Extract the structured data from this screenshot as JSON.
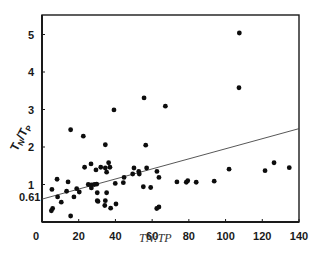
{
  "chart_data": {
    "type": "scatter",
    "title": "",
    "xlabel": "TN:TP",
    "ylabel": "T_N/T_P",
    "xlim": [
      0,
      140
    ],
    "ylim": [
      0,
      5.5
    ],
    "x_ticks": [
      0,
      20,
      40,
      60,
      80,
      100,
      120,
      140
    ],
    "y_ticks": [
      1,
      2,
      3,
      4,
      5
    ],
    "y_annotation": {
      "value": 0.61,
      "label": "0.61"
    },
    "grid": false,
    "legend": null,
    "regression_line": {
      "x": [
        0,
        140
      ],
      "y": [
        0.61,
        2.49
      ]
    },
    "series": [
      {
        "name": "observations",
        "points": [
          [
            15.6,
            2.46
          ],
          [
            22.5,
            2.29
          ],
          [
            23.2,
            1.46
          ],
          [
            26.7,
            1.55
          ],
          [
            29.4,
            1.39
          ],
          [
            8.2,
            1.14
          ],
          [
            14.2,
            1.07
          ],
          [
            5.4,
            0.87
          ],
          [
            13.4,
            0.82
          ],
          [
            18.9,
            0.89
          ],
          [
            20.3,
            0.8
          ],
          [
            17.4,
            0.67
          ],
          [
            8.5,
            0.67
          ],
          [
            10.5,
            0.53
          ],
          [
            5.8,
            0.36
          ],
          [
            5.1,
            0.3
          ],
          [
            15.6,
            0.16
          ],
          [
            25.2,
            1.0
          ],
          [
            26.9,
            0.99
          ],
          [
            28.5,
            1.0
          ],
          [
            29.8,
            1.01
          ],
          [
            26.9,
            0.91
          ],
          [
            30.1,
            0.78
          ],
          [
            30.1,
            0.57
          ],
          [
            32.0,
            1.46
          ],
          [
            34.5,
            1.44
          ],
          [
            36.3,
            1.58
          ],
          [
            37.0,
            1.46
          ],
          [
            35.2,
            1.33
          ],
          [
            35.2,
            0.78
          ],
          [
            30.5,
            0.55
          ],
          [
            34.5,
            0.57
          ],
          [
            34.2,
            0.44
          ],
          [
            37.4,
            0.37
          ],
          [
            40.3,
            0.48
          ],
          [
            39.9,
            1.03
          ],
          [
            44.7,
            1.19
          ],
          [
            44.3,
            1.05
          ],
          [
            50.1,
            1.44
          ],
          [
            49.4,
            1.28
          ],
          [
            52.7,
            1.35
          ],
          [
            53.0,
            1.28
          ],
          [
            57.0,
            1.44
          ],
          [
            55.2,
            0.94
          ],
          [
            59.2,
            0.92
          ],
          [
            62.5,
            0.36
          ],
          [
            63.7,
            0.4
          ],
          [
            62.6,
            1.35
          ],
          [
            63.7,
            1.19
          ],
          [
            39.2,
            2.99
          ],
          [
            34.5,
            2.06
          ],
          [
            55.6,
            3.31
          ],
          [
            67.2,
            3.09
          ],
          [
            56.5,
            2.05
          ],
          [
            107.5,
            5.04
          ],
          [
            107.3,
            3.58
          ],
          [
            73.5,
            1.07
          ],
          [
            78.6,
            1.06
          ],
          [
            79.4,
            1.1
          ],
          [
            84.0,
            1.06
          ],
          [
            93.8,
            1.09
          ],
          [
            101.9,
            1.41
          ],
          [
            121.5,
            1.37
          ],
          [
            126.4,
            1.58
          ],
          [
            134.7,
            1.45
          ]
        ]
      }
    ]
  },
  "labels": {
    "x_title_a": "TN",
    "x_title_sep": ":",
    "x_title_b": "TP",
    "y_title_main_1": "T",
    "y_title_sub_1": "N",
    "y_title_slash": "/",
    "y_title_main_2": "T",
    "y_title_sub_2": "P",
    "y_annotation": "0.61"
  },
  "colors": {
    "axis": "#1a1a1a",
    "point": "#0d0d0d",
    "line": "#444444"
  }
}
